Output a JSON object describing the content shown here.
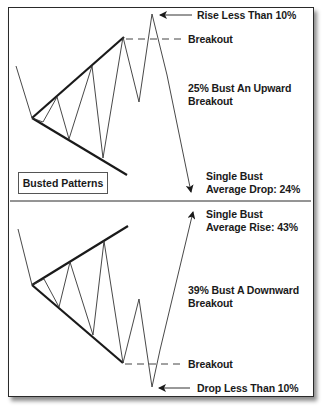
{
  "diagram": {
    "title_box": "Busted Patterns",
    "colors": {
      "line": "#2a2a2a",
      "text": "#1a1a1a",
      "background": "#ffffff"
    },
    "top_panel": {
      "label_rise_less": "Rise Less Than 10%",
      "label_breakout": "Breakout",
      "label_bust_line1": "25% Bust An Upward",
      "label_bust_line2": "Breakout",
      "label_single_line1": "Single Bust",
      "label_single_line2": "Average Drop: 24%"
    },
    "bottom_panel": {
      "label_single_line1": "Single Bust",
      "label_single_line2": "Average Rise: 43%",
      "label_bust_line1": "39% Bust A Downward",
      "label_bust_line2": "Breakout",
      "label_breakout": "Breakout",
      "label_drop_less": "Drop Less Than 10%"
    }
  }
}
